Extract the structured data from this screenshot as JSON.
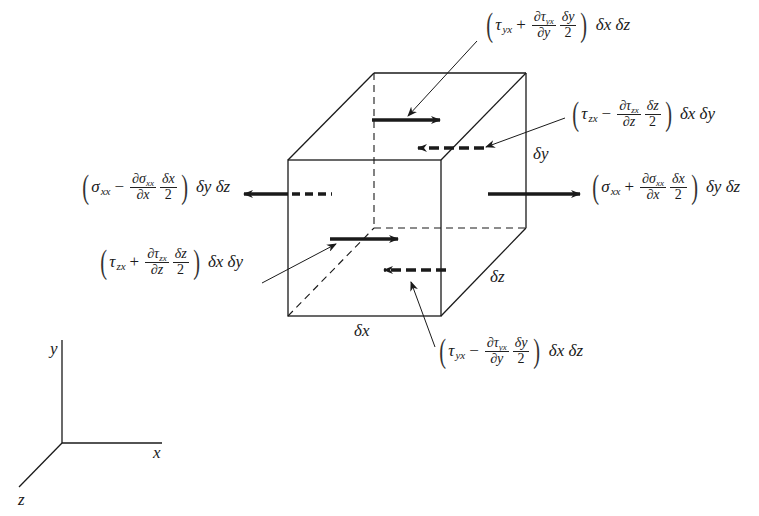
{
  "diagram": {
    "type": "3D stress element (differential cube) with surface forces in x-direction",
    "cube": {
      "front_face": {
        "x1": 288,
        "y1": 160,
        "x2": 441,
        "y2": 316
      },
      "depth_offset": {
        "dx": 86,
        "dy": -87
      },
      "dimension_labels": {
        "dx": "δx",
        "dy": "δy",
        "dz": "δz"
      }
    },
    "forces": [
      {
        "id": "sigma_xx_plus",
        "label_main": "σ",
        "label_sub": "xx",
        "sign": "+",
        "num_main": "∂σ",
        "num_sub": "xx",
        "den": "∂x",
        "half_num": "δx",
        "half_den": "2",
        "tail": "δy δz"
      },
      {
        "id": "sigma_xx_minus",
        "label_main": "σ",
        "label_sub": "xx",
        "sign": "−",
        "num_main": "∂σ",
        "num_sub": "xx",
        "den": "∂x",
        "half_num": "δx",
        "half_den": "2",
        "tail": "δy δz"
      },
      {
        "id": "tau_yx_plus",
        "label_main": "τ",
        "label_sub": "yx",
        "sign": "+",
        "num_main": "∂τ",
        "num_sub": "yx",
        "den": "∂y",
        "half_num": "δy",
        "half_den": "2",
        "tail": "δx δz"
      },
      {
        "id": "tau_yx_minus",
        "label_main": "τ",
        "label_sub": "yx",
        "sign": "−",
        "num_main": "∂τ",
        "num_sub": "yx",
        "den": "∂y",
        "half_num": "δy",
        "half_den": "2",
        "tail": "δx δz"
      },
      {
        "id": "tau_zx_plus",
        "label_main": "τ",
        "label_sub": "zx",
        "sign": "+",
        "num_main": "∂τ",
        "num_sub": "zx",
        "den": "∂z",
        "half_num": "δz",
        "half_den": "2",
        "tail": "δx δy"
      },
      {
        "id": "tau_zx_minus",
        "label_main": "τ",
        "label_sub": "zx",
        "sign": "−",
        "num_main": "∂τ",
        "num_sub": "zx",
        "den": "∂z",
        "half_num": "δz",
        "half_den": "2",
        "tail": "δx δy"
      }
    ],
    "axes": {
      "x": "x",
      "y": "y",
      "z": "z"
    },
    "colors": {
      "line": "#1a1a1a",
      "background": "#ffffff"
    }
  }
}
